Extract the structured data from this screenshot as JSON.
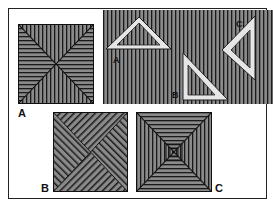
{
  "figure": {
    "labels": {
      "square_a": "A",
      "triangle_a": "A",
      "triangle_b": "B",
      "triangle_c": "C",
      "square_b": "B",
      "square_c": "C"
    },
    "colors": {
      "stripe_fill": "#8a8a8a",
      "stripe_line": "#1a1a1a",
      "triangle_fill": "#e6e6e6",
      "background": "#ffffff"
    }
  }
}
